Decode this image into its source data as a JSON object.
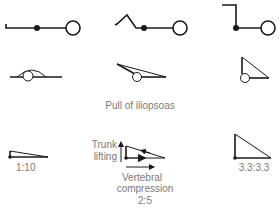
{
  "diagram": {
    "caption": "Pull of iliopsoas",
    "ratios": [
      {
        "label": "1:10"
      },
      {
        "label": "2:5"
      },
      {
        "label": "3.3:3.3"
      }
    ],
    "force_labels": {
      "vertical": [
        "Trunk",
        "lifting"
      ],
      "horizontal": [
        "Vertebral",
        "compression"
      ]
    },
    "colors": {
      "line": "#1a1a1a",
      "text": "#7a7a7a",
      "background": "#ffffff"
    }
  }
}
